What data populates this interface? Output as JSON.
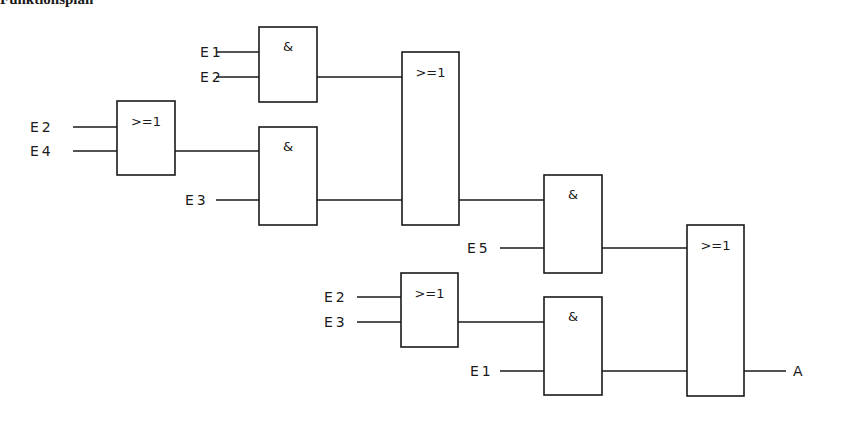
{
  "heading": "Funktionsplan",
  "colors": {
    "line": "#1a1a1a",
    "background": "#ffffff"
  },
  "gates": [
    {
      "id": "or1",
      "type": "OR",
      "symbol": ">=1",
      "x": 117,
      "y": 101,
      "w": 58,
      "h": 74
    },
    {
      "id": "and1",
      "type": "AND",
      "symbol": "&",
      "x": 259,
      "y": 27,
      "w": 58,
      "h": 75
    },
    {
      "id": "and2",
      "type": "AND",
      "symbol": "&",
      "x": 259,
      "y": 127,
      "w": 58,
      "h": 98
    },
    {
      "id": "or2",
      "type": "OR",
      "symbol": ">=1",
      "x": 402,
      "y": 52,
      "w": 57,
      "h": 173
    },
    {
      "id": "and3",
      "type": "AND",
      "symbol": "&",
      "x": 544,
      "y": 175,
      "w": 58,
      "h": 98
    },
    {
      "id": "or3",
      "type": "OR",
      "symbol": ">=1",
      "x": 401,
      "y": 273,
      "w": 57,
      "h": 74
    },
    {
      "id": "and4",
      "type": "AND",
      "symbol": "&",
      "x": 544,
      "y": 297,
      "w": 58,
      "h": 98
    },
    {
      "id": "or4",
      "type": "OR",
      "symbol": ">=1",
      "x": 687,
      "y": 225,
      "w": 57,
      "h": 171
    }
  ],
  "inputs": [
    {
      "label": "E1",
      "x": 200,
      "y": 52,
      "x1": 216,
      "x2": 259
    },
    {
      "label": "E2",
      "x": 200,
      "y": 77,
      "x1": 216,
      "x2": 259
    },
    {
      "label": "E2",
      "x": 30,
      "y": 127,
      "x1": 73,
      "x2": 117
    },
    {
      "label": "E4",
      "x": 30,
      "y": 151,
      "x1": 73,
      "x2": 117
    },
    {
      "label": "E3",
      "x": 185,
      "y": 200,
      "x1": 216,
      "x2": 259
    },
    {
      "label": "E5",
      "x": 467,
      "y": 248,
      "x1": 500,
      "x2": 544
    },
    {
      "label": "E2",
      "x": 324,
      "y": 297,
      "x1": 357,
      "x2": 401
    },
    {
      "label": "E3",
      "x": 324,
      "y": 322,
      "x1": 357,
      "x2": 401
    },
    {
      "label": "E1",
      "x": 470,
      "y": 371,
      "x1": 500,
      "x2": 544
    }
  ],
  "wires": [
    {
      "from": "or1",
      "to": "and2",
      "x1": 175,
      "x2": 259,
      "y": 151
    },
    {
      "from": "and1",
      "to": "or2",
      "x1": 317,
      "x2": 402,
      "y": 77
    },
    {
      "from": "and2",
      "to": "or2",
      "x1": 317,
      "x2": 402,
      "y": 200
    },
    {
      "from": "or2",
      "to": "and3",
      "x1": 459,
      "x2": 544,
      "y": 200
    },
    {
      "from": "and3",
      "to": "or4",
      "x1": 602,
      "x2": 687,
      "y": 248
    },
    {
      "from": "or3",
      "to": "and4",
      "x1": 458,
      "x2": 544,
      "y": 322
    },
    {
      "from": "and4",
      "to": "or4",
      "x1": 602,
      "x2": 687,
      "y": 371
    }
  ],
  "output": {
    "label": "A",
    "x1": 744,
    "x2": 786,
    "y": 371,
    "label_x": 793
  }
}
